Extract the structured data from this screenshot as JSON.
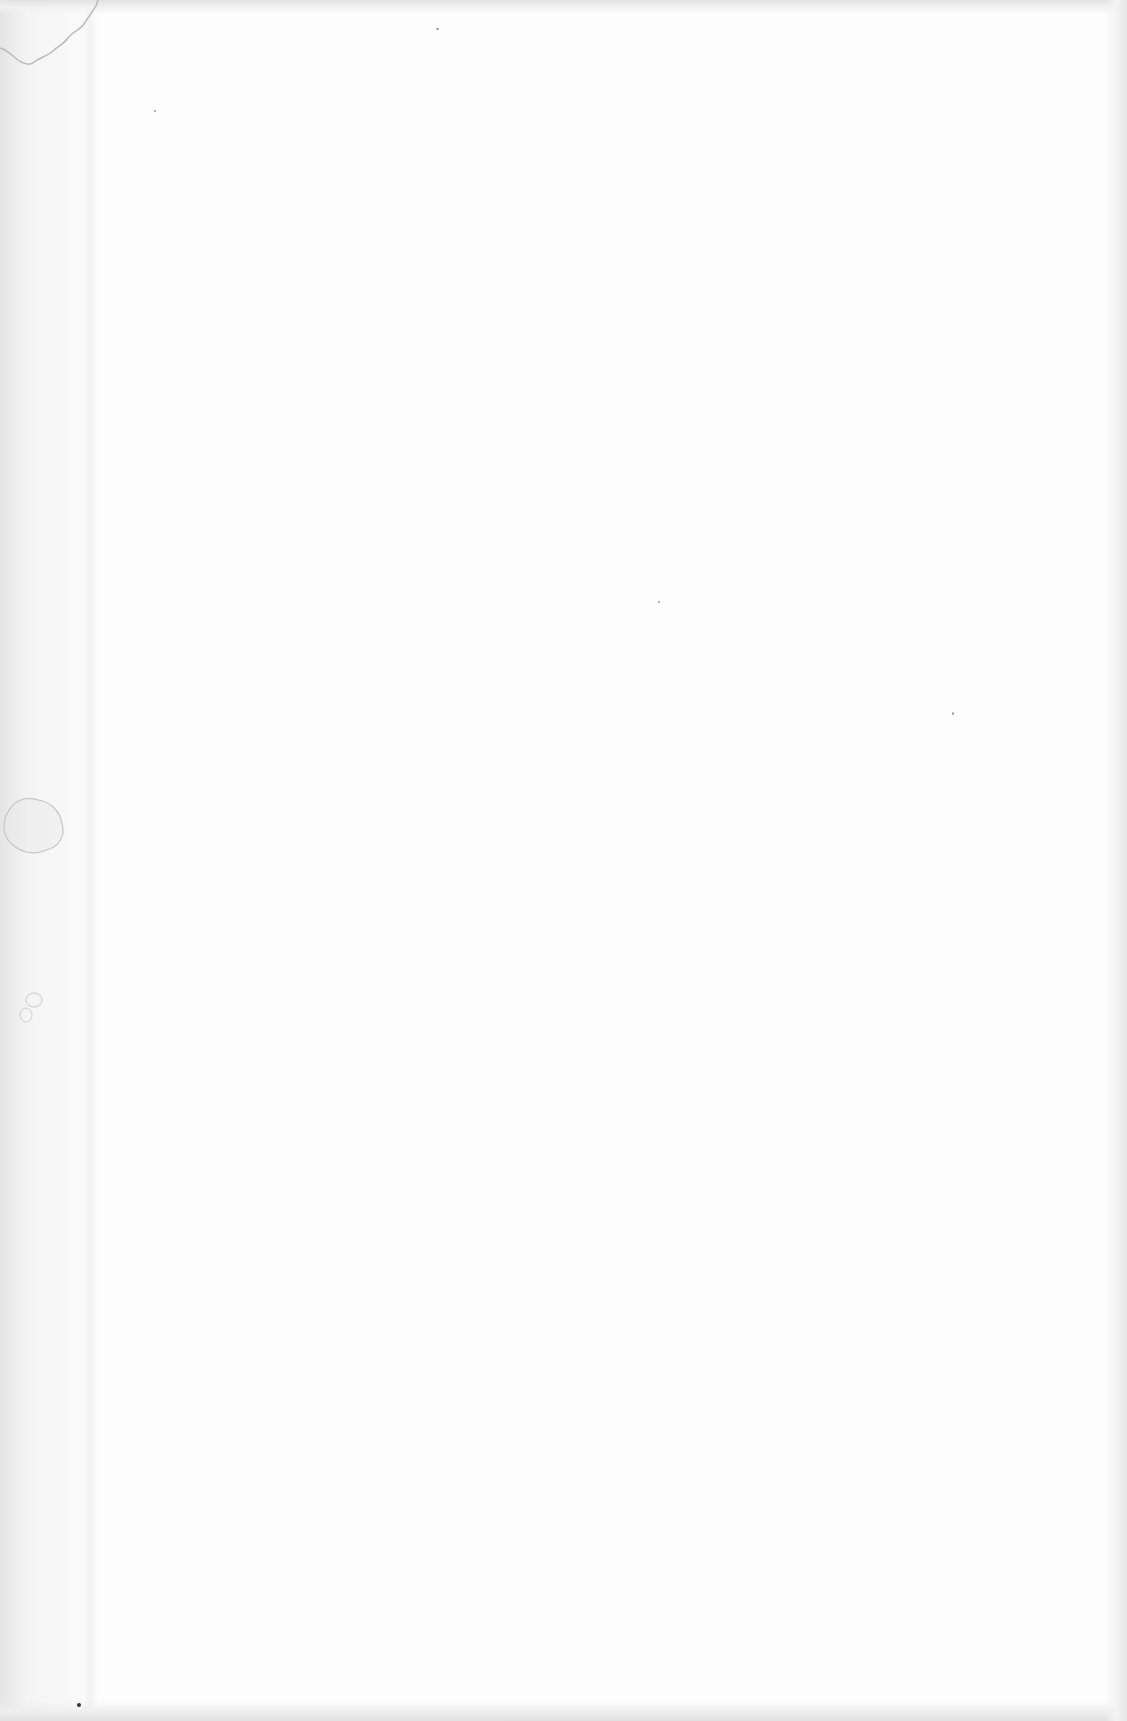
{
  "page": {
    "type": "blank scanned page",
    "text_content": "",
    "colors": {
      "paper": "#fdfdfd",
      "gutter_shadow": "#e4e4e4",
      "stain_outline": "#b8b8b8",
      "speck": "#9a9a9a"
    }
  }
}
